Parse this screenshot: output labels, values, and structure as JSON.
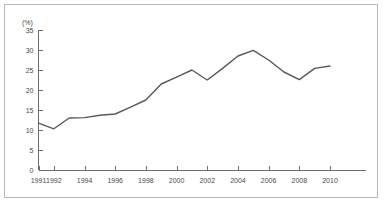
{
  "chart_data": {
    "type": "line",
    "title": "",
    "subtitle": "",
    "xlabel": "",
    "ylabel": "",
    "yunit": "(%)",
    "x": [
      1991,
      1992,
      1993,
      1994,
      1995,
      1996,
      1997,
      1998,
      1999,
      2000,
      2001,
      2002,
      2003,
      2004,
      2005,
      2006,
      2007,
      2008,
      2009,
      2010
    ],
    "values": [
      11.7,
      10.3,
      13.0,
      13.1,
      13.7,
      14.0,
      15.7,
      17.5,
      21.5,
      23.2,
      25.0,
      22.5,
      25.4,
      28.5,
      29.9,
      27.5,
      24.5,
      22.6,
      25.4,
      26.0
    ],
    "series": [
      {
        "name": "",
        "values": [
          11.7,
          10.3,
          13.0,
          13.1,
          13.7,
          14.0,
          15.7,
          17.5,
          21.5,
          23.2,
          25.0,
          22.5,
          25.4,
          28.5,
          29.9,
          27.5,
          24.5,
          22.6,
          25.4,
          26.0
        ],
        "color": "#595959"
      }
    ],
    "xlim": [
      1991,
      2010
    ],
    "ylim": [
      0,
      35
    ],
    "yticks": [
      0,
      5,
      10,
      15,
      20,
      25,
      30,
      35
    ],
    "ytick_labels": [
      "0",
      "5",
      "10",
      "15",
      "20",
      "25",
      "30",
      "35"
    ],
    "xticks": [
      1991,
      1992,
      1994,
      1996,
      1998,
      2000,
      2002,
      2004,
      2006,
      2008,
      2010
    ],
    "xtick_labels": [
      "1991",
      "1992",
      "1994",
      "1996",
      "1998",
      "2000",
      "2002",
      "2004",
      "2006",
      "2008",
      "2010"
    ],
    "grid": false,
    "legend": false,
    "legend_position": "none",
    "annotations": []
  },
  "colors": {
    "line": "#595959",
    "axis": "#6d6d6d",
    "text": "#4a4a4a",
    "frame": "#b9b9b9",
    "background": "#ffffff"
  }
}
